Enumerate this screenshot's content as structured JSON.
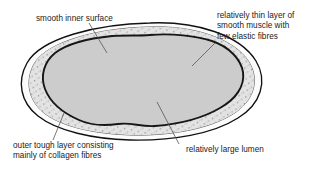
{
  "diagram": {
    "colors": {
      "background": "#ffffff",
      "outline": "#111111",
      "outer_tough_layer_fill": "#fbfbfb",
      "muscle_layer_fill": "#e3e3e3",
      "muscle_speckle": "#8d8d8d",
      "lumen_fill": "#cccccc",
      "endothelium_line": "#161616",
      "leader_line": "#555555",
      "text": "#1a1a1a"
    },
    "labels": {
      "smooth_inner_surface": {
        "lines": [
          "smooth inner surface"
        ],
        "line1": "smooth inner surface"
      },
      "thin_muscle_layer": {
        "lines": [
          "relatively thin layer of",
          "smooth muscle with",
          "few elastic fibres"
        ],
        "line1": "relatively thin layer of",
        "line2": "smooth muscle with",
        "line3": "few elastic fibres"
      },
      "outer_tough_layer": {
        "lines": [
          "outer tough layer consisting",
          "mainly of collagen fibres"
        ],
        "line1": "outer tough layer consisting",
        "line2": "mainly of collagen fibres"
      },
      "large_lumen": {
        "lines": [
          "relatively large lumen"
        ],
        "line1": "relatively large lumen"
      }
    },
    "layers": [
      {
        "name": "outer tough layer consisting mainly of collagen fibres"
      },
      {
        "name": "relatively thin layer of smooth muscle with few elastic fibres"
      },
      {
        "name": "smooth inner surface"
      },
      {
        "name": "relatively large lumen"
      }
    ]
  }
}
